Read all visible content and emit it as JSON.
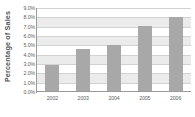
{
  "chart_data": {
    "type": "bar",
    "title": "",
    "subtitle": "",
    "xlabel": "",
    "ylabel": "Percentage of Sales",
    "categories": [
      "2002",
      "2003",
      "2004",
      "2005",
      "2006"
    ],
    "values": [
      2.9,
      4.6,
      5.0,
      7.1,
      8.0
    ],
    "series": [
      {
        "name": "Percentage of Sales",
        "values": [
          2.9,
          4.6,
          5.0,
          7.1,
          8.0
        ]
      }
    ],
    "ylim": [
      0.0,
      9.0
    ],
    "ytick_values": [
      0.0,
      1.0,
      2.0,
      3.0,
      4.0,
      5.0,
      6.0,
      7.0,
      8.0,
      9.0
    ],
    "ytick_labels": [
      "0.0%",
      "1.0%",
      "2.0%",
      "3.0%",
      "4.0%",
      "5.0%",
      "6.0%",
      "7.0%",
      "8.0%",
      "9.0%"
    ],
    "grid": true,
    "grid_orientation": "horizontal",
    "legend": false,
    "legend_position": "none",
    "annotations": [],
    "colors": {
      "bar_fill": "#a8a8a8",
      "gridline": "#d2d2d2",
      "band": "#ebebeb",
      "axis_line": "#9a9a9a",
      "tick_label": "#5d5e62",
      "axis_title": "#55565a",
      "background": "#ffffff"
    }
  }
}
